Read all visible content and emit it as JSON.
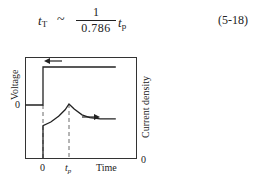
{
  "equation": {
    "lhs_symbol": "t",
    "lhs_sub": "T",
    "relation": "~",
    "numerator": "1",
    "denominator": "0.786",
    "rhs_symbol": "t",
    "rhs_sub": "p",
    "number": "(5-18)"
  },
  "chart_data": {
    "type": "line",
    "title": "",
    "xlabel": "Time",
    "ylabel_left": "Voltage",
    "ylabel_right": "Current density",
    "x_ticks": [
      "0",
      "t_p"
    ],
    "y_left_ticks": [
      "0"
    ],
    "y_right_ticks": [
      "0"
    ],
    "series": [
      {
        "name": "Voltage",
        "axis": "left",
        "arrow": "left",
        "points": [
          [
            -1,
            0
          ],
          [
            0,
            0
          ],
          [
            0,
            1
          ],
          [
            2.8,
            1
          ]
        ]
      },
      {
        "name": "Current density",
        "axis": "right",
        "arrow": "right",
        "points": [
          [
            0,
            0
          ],
          [
            0,
            0.45
          ],
          [
            0.3,
            0.5
          ],
          [
            0.6,
            0.58
          ],
          [
            0.85,
            0.67
          ],
          [
            1,
            0.75
          ],
          [
            1.2,
            0.68
          ],
          [
            1.5,
            0.6
          ],
          [
            1.8,
            0.56
          ],
          [
            2.2,
            0.545
          ],
          [
            2.8,
            0.545
          ]
        ]
      }
    ],
    "annotations": [
      "dashed vertical line at 0",
      "dashed vertical line at t_p"
    ],
    "grid": false
  }
}
